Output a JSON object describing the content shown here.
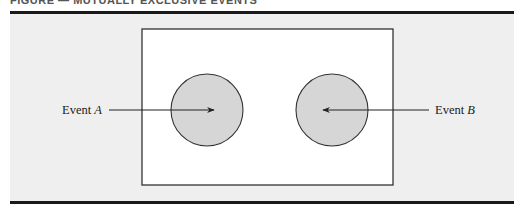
{
  "figure": {
    "caption_partial": "FIGURE — MUTUALLY EXCLUSIVE EVENTS",
    "colors": {
      "panel_background": "#efefef",
      "sample_space_fill": "#ffffff",
      "event_fill": "#d6d6d6",
      "stroke": "#222222",
      "rule": "#1a1a1a"
    },
    "sample_space": {
      "x": 142,
      "y": 29,
      "width": 251,
      "height": 156
    },
    "events": [
      {
        "id": "A",
        "label_prefix": "Event",
        "label_var": "A",
        "cx": 207,
        "cy": 110,
        "r": 36,
        "label_x": 62,
        "label_y": 103,
        "arrow_from": [
          109,
          110
        ],
        "arrow_to": [
          214,
          110
        ]
      },
      {
        "id": "B",
        "label_prefix": "Event",
        "label_var": "B",
        "cx": 332,
        "cy": 110,
        "r": 36,
        "label_x": 435,
        "label_y": 103,
        "arrow_from": [
          429,
          110
        ],
        "arrow_to": [
          323,
          110
        ]
      }
    ]
  }
}
